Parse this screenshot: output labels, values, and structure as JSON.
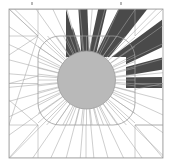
{
  "figure": {
    "canvas": {
      "width": 172,
      "height": 167
    },
    "background_color": "#ffffff"
  },
  "chart_data": {
    "type": "scatter",
    "xlabel": "",
    "ylabel": "",
    "grid": false,
    "legend": "none",
    "xlim": [
      9,
      163
    ],
    "ylim": [
      9,
      158
    ],
    "categories": [],
    "values": []
  },
  "frame": {
    "name": "outer-square-frame",
    "x": 9,
    "y": 9,
    "width": 154,
    "height": 149,
    "stroke_color": "#9a9a9a",
    "stroke_width": 0.8,
    "fill": "none"
  },
  "rounded_square": {
    "name": "rounded-square-outline",
    "x": 38,
    "y": 36,
    "width": 97,
    "height": 89,
    "corner_radius": 22,
    "stroke_color": "#9a9a9a",
    "stroke_width": 0.8,
    "fill": "none"
  },
  "center_disc": {
    "name": "center-gray-circle",
    "cx": 86.5,
    "cy": 80,
    "r": 29,
    "fill_color": "#b9b9b9",
    "stroke_color": "#9a9a9a",
    "stroke_width": 0.8
  },
  "dark_region": {
    "name": "dark-upper-right-quadrant",
    "fill_color": "#4a4a4a",
    "left_x": 66,
    "top_y": 10,
    "right_x": 162,
    "bottom_y": 88,
    "spike_count": 6,
    "spike_fill_color": "#ffffff"
  },
  "spokes": {
    "name": "radiating-spoke-lines",
    "stroke_color": "#a5a5a5",
    "stroke_width": 0.55,
    "inner_count": 52,
    "inner_radius_start": 29,
    "outer_count": 36
  },
  "cross_lines": {
    "name": "corner-cross-lines",
    "stroke_color": "#a5a5a5",
    "stroke_width": 0.55
  },
  "tick_marks": {
    "name": "top-edge-tick-marks",
    "color": "#b8b8b8",
    "positions": [
      31,
      120
    ],
    "y": 2
  }
}
